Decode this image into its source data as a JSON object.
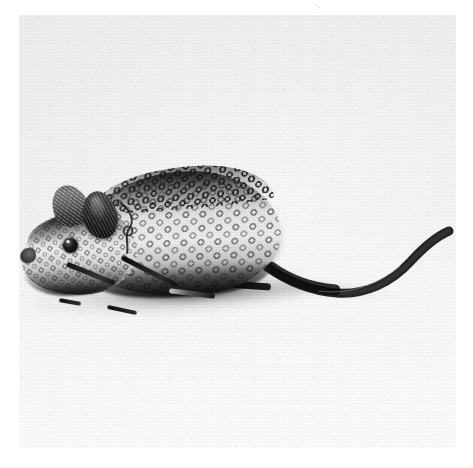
{
  "document": {
    "type": "photograph",
    "medium": "black-and-white halftone print",
    "page_background": "#ffffff"
  },
  "photo": {
    "subject": "beaded toy mouse figurine",
    "orientation": "left-facing profile",
    "background_description": "plain pale studio sweep",
    "background_color": "#f1f1f2",
    "ink_color": "#111111",
    "frame": {
      "x": 19,
      "y": 15,
      "width": 437,
      "height": 433
    },
    "parts": [
      {
        "name": "body",
        "description": "ovoid torso covered in rows of small ring-shaped beads"
      },
      {
        "name": "head",
        "description": "tapered beaded head with pointed snout"
      },
      {
        "name": "ear-far",
        "description": "dark flattened far ear, fur-textured"
      },
      {
        "name": "ear-near",
        "description": "dark rounded near ear, fur-textured"
      },
      {
        "name": "eye",
        "description": "single round black bead eye"
      },
      {
        "name": "nose",
        "description": "dark rounded snout tip"
      },
      {
        "name": "spine-band",
        "description": "dense dark loop beading along the back ridge"
      },
      {
        "name": "front-legs",
        "description": "two thin dark wire forelegs angled forward-down"
      },
      {
        "name": "hind-leg",
        "description": "dark hind leg along the lower body"
      },
      {
        "name": "tail",
        "description": "long dark S-curved tail sweeping right and tipping upward"
      },
      {
        "name": "shadow",
        "description": "soft grey cast shadow beneath the figure"
      }
    ],
    "tail_path": "M 248 252 C 268 266, 292 276, 318 278 C 346 280, 372 268, 392 246 C 404 233, 416 222, 430 216",
    "tail_tip": {
      "x": 432,
      "y": 214
    }
  },
  "artifacts": {
    "top_speck": "faint scan speck near top centre"
  }
}
